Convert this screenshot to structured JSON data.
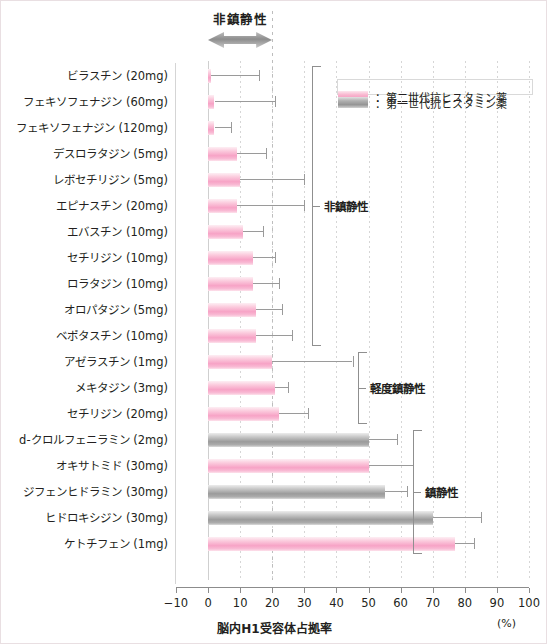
{
  "annotation": {
    "top_label": "非鎮静性",
    "arrow_icon": "double-headed-arrow-icon"
  },
  "legend": {
    "items": [
      {
        "label": "：第二世代抗ヒスタミン薬",
        "color": "#f7a3c6",
        "key": "second-generation"
      },
      {
        "label": "：第一世代抗ヒスタミン薬",
        "color": "#9b9b9b",
        "key": "first-generation"
      }
    ]
  },
  "brackets": [
    {
      "label": "非鎮静性",
      "from_index": 0,
      "to_index": 10
    },
    {
      "label": "軽度鎮静性",
      "from_index": 11,
      "to_index": 13
    },
    {
      "label": "鎮静性",
      "from_index": 14,
      "to_index": 18
    }
  ],
  "axis": {
    "ticks": [
      -10,
      0,
      10,
      20,
      30,
      40,
      50,
      60,
      70,
      80,
      90,
      100
    ],
    "title": "脳内H1受容体占拠率",
    "unit": "(%)"
  },
  "chart_data": {
    "type": "bar",
    "orientation": "horizontal",
    "title": "脳内H1受容体占拠率",
    "xlabel": "脳内H1受容体占拠率",
    "ylabel": "",
    "xlim": [
      -10,
      100
    ],
    "xunit": "(%)",
    "grid": true,
    "reference_line": 20,
    "legend_position": "top-right",
    "categories": [
      "ビラスチン (20mg)",
      "フェキソフェナジン (60mg)",
      "フェキソフェナジン (120mg)",
      "デスロラタジン (5mg)",
      "レボセチリジン (5mg)",
      "エピナスチン (20mg)",
      "エバスチン (10mg)",
      "セチリジン (10mg)",
      "ロラタジン (10mg)",
      "オロパタジン (5mg)",
      "ベポタスチン (10mg)",
      "アゼラスチン (1mg)",
      "メキタジン (3mg)",
      "セチリジン (20mg)",
      "d-クロルフェニラミン (2mg)",
      "オキサトミド (30mg)",
      "ジフェンヒドラミン (30mg)",
      "ヒドロキシジン (30mg)",
      "ケトチフェン (1mg)"
    ],
    "values": [
      1,
      2,
      2,
      9,
      10,
      9,
      11,
      14,
      14,
      15,
      15,
      20,
      21,
      22,
      50,
      50,
      55,
      70,
      77
    ],
    "errors_upper": [
      16,
      21,
      7,
      18,
      30,
      30,
      17,
      21,
      22,
      23,
      26,
      45,
      25,
      31,
      59,
      64,
      62,
      85,
      83
    ],
    "generations": [
      "second-generation",
      "second-generation",
      "second-generation",
      "second-generation",
      "second-generation",
      "second-generation",
      "second-generation",
      "second-generation",
      "second-generation",
      "second-generation",
      "second-generation",
      "second-generation",
      "second-generation",
      "second-generation",
      "first-generation",
      "second-generation",
      "first-generation",
      "first-generation",
      "second-generation"
    ]
  }
}
